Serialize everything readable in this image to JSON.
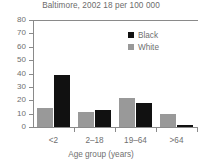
{
  "chart_data": {
    "type": "bar",
    "title": "Baltimore, 2002 18 per 100 000",
    "xlabel": "Age group (years)",
    "ylabel": "",
    "categories": [
      "<2",
      "2–18",
      "19–64",
      ">64"
    ],
    "series": [
      {
        "name": "White",
        "color": "#999999",
        "values": [
          14,
          11,
          22,
          10
        ]
      },
      {
        "name": "Black",
        "color": "#111111",
        "values": [
          39,
          13,
          18,
          1.5
        ]
      }
    ],
    "ylim": [
      0,
      80
    ],
    "yticks": [
      0,
      10,
      20,
      30,
      40,
      50,
      60,
      70,
      80
    ],
    "ytick_labels": [
      "0",
      "10",
      "20",
      "30",
      "40",
      "50",
      "60",
      "70",
      "80"
    ],
    "grid": false,
    "legend_position": "top-right",
    "legend_entries": [
      {
        "label": "Black",
        "color": "#111111"
      },
      {
        "label": "White",
        "color": "#999999"
      }
    ]
  }
}
